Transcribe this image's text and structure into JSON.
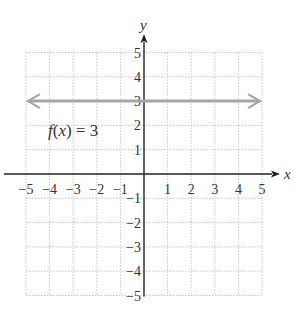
{
  "chart_data": {
    "type": "line",
    "title": "",
    "xlabel": "x",
    "ylabel": "y",
    "xlim": [
      -5,
      5
    ],
    "ylim": [
      -5,
      5
    ],
    "grid": true,
    "x_ticks": [
      "-5",
      "-4",
      "-3",
      "-2",
      "-1",
      "1",
      "2",
      "3",
      "4",
      "5"
    ],
    "y_ticks": [
      "5",
      "4",
      "3",
      "2",
      "1",
      "-1",
      "-2",
      "-3",
      "-4",
      "-5"
    ],
    "series": [
      {
        "name": "f(x) = 3",
        "x": [
          -5,
          5
        ],
        "values": [
          3,
          3
        ],
        "color": "#a6a6a6",
        "arrows": "both"
      }
    ],
    "annotations": [
      {
        "text": "f(x) = 3",
        "x": -4.5,
        "y": 1.3
      }
    ]
  },
  "labels": {
    "x_axis": "x",
    "y_axis": "y",
    "annotation": {
      "f": "f",
      "paren_open": "(",
      "var": "x",
      "rest": ") = 3"
    }
  },
  "colors": {
    "axis": "#222222",
    "grid": "#c8c8c8",
    "line": "#a6a6a6",
    "text": "#333333"
  }
}
